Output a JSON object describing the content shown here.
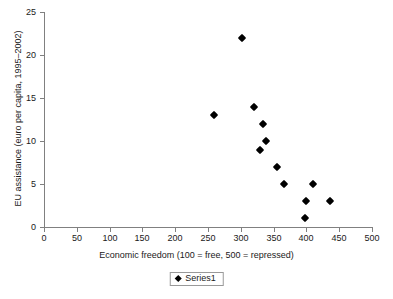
{
  "chart_data": {
    "type": "scatter",
    "title": "",
    "xlabel": "Economic freedom (100 = free, 500 = repressed)",
    "ylabel": "EU assistance (euro per capita, 1995–2002)",
    "xlim": [
      0,
      500
    ],
    "ylim": [
      0,
      25
    ],
    "xticks": [
      0,
      50,
      100,
      150,
      200,
      250,
      300,
      350,
      400,
      450,
      500
    ],
    "yticks": [
      0,
      5,
      10,
      15,
      20,
      25
    ],
    "xtick_labels": [
      "0",
      "50",
      "100",
      "150",
      "200",
      "250",
      "300",
      "350",
      "400",
      "450",
      "500"
    ],
    "ytick_labels": [
      "0",
      "5",
      "10",
      "15",
      "20",
      "25"
    ],
    "grid": false,
    "legend_position": "bottom",
    "marker": "diamond",
    "marker_color": "#000000",
    "series": [
      {
        "name": "Series1",
        "points": [
          {
            "x": 259,
            "y": 13
          },
          {
            "x": 302,
            "y": 22
          },
          {
            "x": 320,
            "y": 14
          },
          {
            "x": 329,
            "y": 9
          },
          {
            "x": 334,
            "y": 12
          },
          {
            "x": 338,
            "y": 10
          },
          {
            "x": 355,
            "y": 7
          },
          {
            "x": 366,
            "y": 5
          },
          {
            "x": 398,
            "y": 1
          },
          {
            "x": 400,
            "y": 3
          },
          {
            "x": 410,
            "y": 5
          },
          {
            "x": 436,
            "y": 3
          }
        ]
      }
    ]
  },
  "legend": {
    "entries": [
      {
        "label": "Series1",
        "marker": "diamond-marker-icon"
      }
    ]
  }
}
